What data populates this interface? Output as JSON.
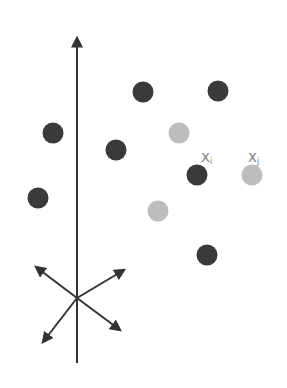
{
  "diagram": {
    "colors": {
      "dark": "#3a3a3a",
      "light": "#bdbdbd",
      "axis": "#333333",
      "label": "#7a7a7a"
    },
    "labels": {
      "xi_main": "X",
      "xi_sub": "i",
      "xj_main": "X",
      "xj_sub": "j"
    },
    "axis": {
      "x": 77,
      "y_top": 34,
      "y_bottom": 363
    },
    "star_center": [
      77,
      298
    ],
    "points": [
      {
        "x": 143,
        "y": 92,
        "shade": "dark"
      },
      {
        "x": 218,
        "y": 91,
        "shade": "dark"
      },
      {
        "x": 53,
        "y": 133,
        "shade": "dark"
      },
      {
        "x": 179,
        "y": 133,
        "shade": "light"
      },
      {
        "x": 116,
        "y": 150,
        "shade": "dark"
      },
      {
        "x": 197,
        "y": 175,
        "shade": "dark",
        "label": "Xi"
      },
      {
        "x": 252,
        "y": 175,
        "shade": "light",
        "label": "Xj"
      },
      {
        "x": 38,
        "y": 198,
        "shade": "dark"
      },
      {
        "x": 158,
        "y": 211,
        "shade": "light"
      },
      {
        "x": 207,
        "y": 255,
        "shade": "dark"
      }
    ]
  }
}
